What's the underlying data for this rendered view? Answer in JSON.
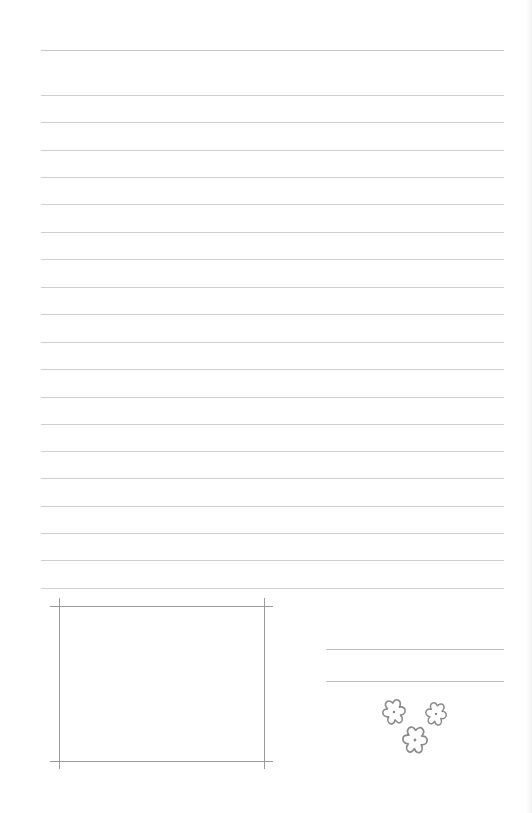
{
  "page": {
    "type": "lined-stationery",
    "background": "#ffffff",
    "line_color": "#cfcfcf",
    "frame_color": "#9a9a9a"
  },
  "lines": {
    "count": 20,
    "positions_y": [
      50,
      95,
      122,
      150,
      177,
      204,
      232,
      259,
      287,
      314,
      342,
      369,
      397,
      424,
      451,
      478,
      506,
      533,
      560,
      588
    ],
    "text": []
  },
  "photo_frame": {
    "label": "",
    "content": ""
  },
  "signature_lines": {
    "count": 2,
    "values": [
      "",
      ""
    ]
  },
  "decoration": {
    "icon": "flower-icon",
    "count": 3
  }
}
